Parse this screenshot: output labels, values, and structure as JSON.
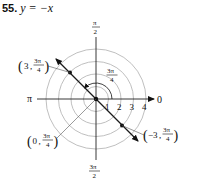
{
  "problem": {
    "number": "55.",
    "equation": "y = −x"
  },
  "polar_plot": {
    "center": [
      96,
      99
    ],
    "unit_px": 12.5,
    "rings": [
      1,
      2,
      3,
      4
    ],
    "ring_labels": [
      "1",
      "2",
      "3",
      "4"
    ],
    "axis_labels": {
      "right": "0",
      "left": "π",
      "top_num": "π",
      "top_den": "2",
      "bottom_num": "3π",
      "bottom_den": "2"
    },
    "angle_marker": {
      "num": "3π",
      "den": "4"
    },
    "line": {
      "description": "line through origin at angle 3π/4",
      "color": "#1a1a1a"
    },
    "points": [
      {
        "label_r": "3",
        "label_theta_num": "3π",
        "label_theta_den": "4",
        "display": "(3, 3π/4)"
      },
      {
        "label_r": "0",
        "label_theta_num": "3π",
        "label_theta_den": "4",
        "display": "(0, 3π/4)"
      },
      {
        "label_r": "−3",
        "label_theta_num": "3π",
        "label_theta_den": "4",
        "display": "(−3, 3π/4)"
      }
    ],
    "colors": {
      "grid": "#b8b8b8",
      "axis": "#222222",
      "line": "#1a1a1a"
    }
  }
}
